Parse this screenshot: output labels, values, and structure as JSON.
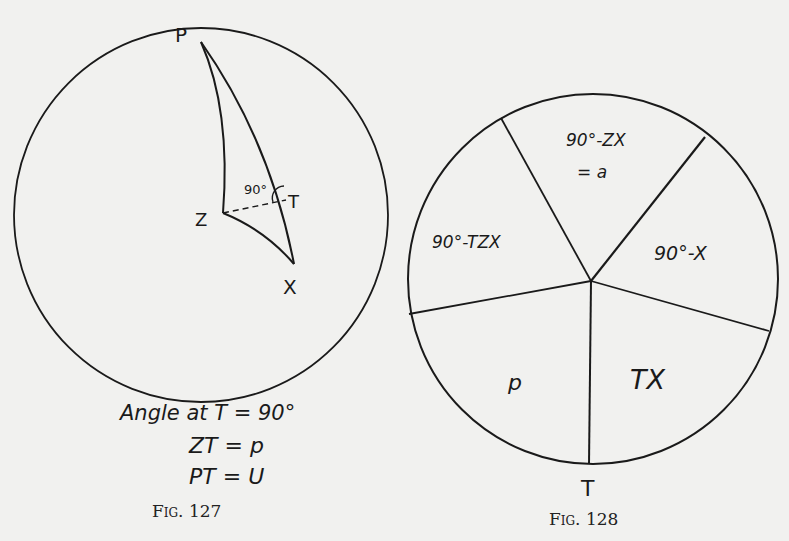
{
  "fig127": {
    "points": {
      "P": "P",
      "Z": "Z",
      "T": "T",
      "X": "X"
    },
    "angle_label": "90°",
    "equations": [
      "Angle at T = 90°",
      "ZT = p",
      "PT = U"
    ],
    "caption": "Fig. 127"
  },
  "fig128": {
    "segments": [
      "90°-ZX",
      "= a",
      "90°-X",
      "TX",
      "p",
      "90°-TZX"
    ],
    "bottom_label": "T",
    "caption": "Fig. 128"
  },
  "colors": {
    "ink": "#1a1a1a",
    "paper": "#f1f1ef"
  }
}
